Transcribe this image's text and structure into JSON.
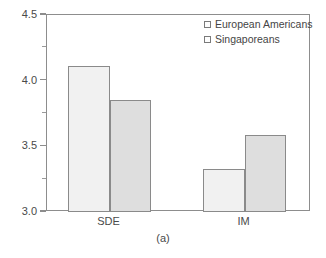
{
  "chart_data": {
    "type": "bar",
    "title": "",
    "subtitle": "",
    "caption": "(a)",
    "xlabel": "",
    "ylabel": "",
    "categories": [
      "SDE",
      "IM"
    ],
    "series": [
      {
        "name": "European Americans",
        "values": [
          4.11,
          3.33
        ],
        "color": "#f1f1f1"
      },
      {
        "name": "Singaporeans",
        "values": [
          3.85,
          3.59
        ],
        "color": "#dedede"
      }
    ],
    "ylim": [
      3.0,
      4.5
    ],
    "ytick_labels": [
      "3.0",
      "3.5",
      "4.0",
      "4.5"
    ],
    "ytick_values": [
      3.0,
      3.5,
      4.0,
      4.5
    ],
    "yminor_values": [
      3.25,
      3.75,
      4.25
    ],
    "grid": false,
    "legend_position": "top-right",
    "frame": true
  },
  "legend": {
    "items": [
      {
        "label": "European Americans",
        "swatch_name": "legend-swatch-european-americans"
      },
      {
        "label": "Singaporeans",
        "swatch_name": "legend-swatch-singaporeans"
      }
    ]
  },
  "axis": {
    "y_labels": [
      "4.5",
      "4.0",
      "3.5",
      "3.0"
    ]
  },
  "categories": {
    "items": [
      "SDE",
      "IM"
    ]
  },
  "caption": {
    "text": "(a)"
  }
}
